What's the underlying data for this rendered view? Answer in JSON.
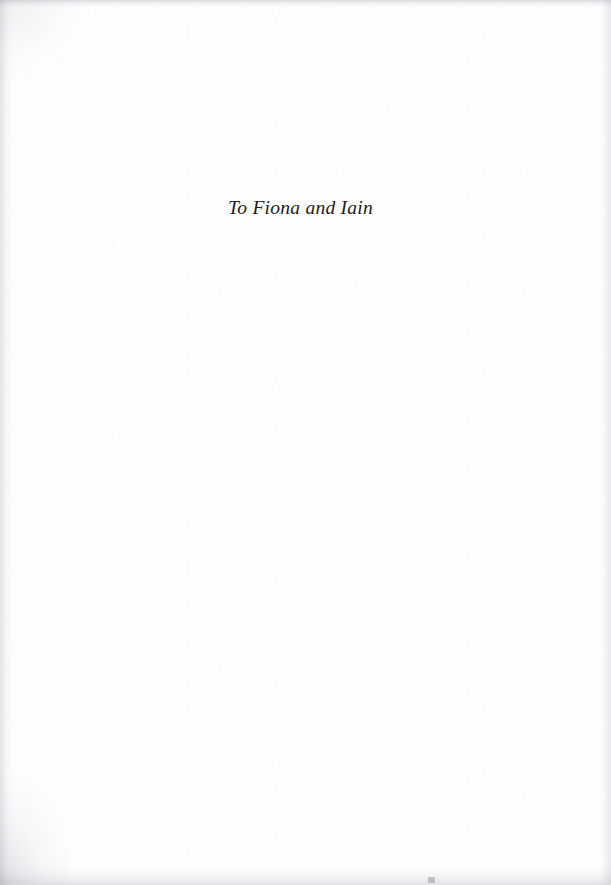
{
  "page": {
    "kind": "book-dedication-page",
    "width": 611,
    "height": 885,
    "background_color": "#fefefe",
    "ink_color": "#1b1b1b"
  },
  "dedication": {
    "text": "To Fiona and Iain"
  },
  "artifacts": {
    "top_edge_label": "scan-edge-shadow-top",
    "bottom_edge_label": "scan-edge-shadow-bottom",
    "left_edge_label": "scan-edge-shadow-left",
    "right_edge_label": "scan-edge-shadow-right",
    "speck_label": "scan-speck"
  }
}
